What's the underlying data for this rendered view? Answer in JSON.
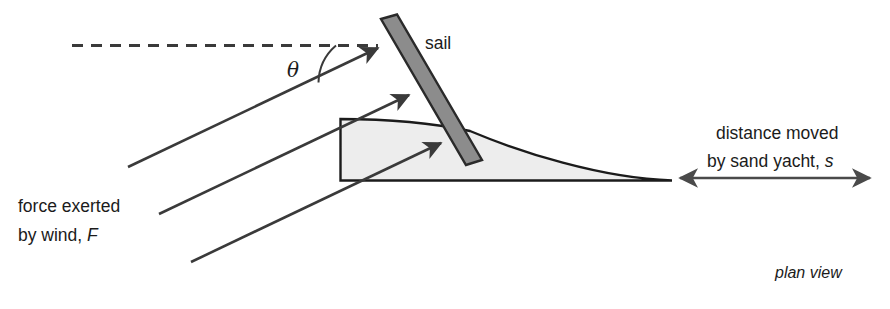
{
  "figure": {
    "title_note": "plan view",
    "background_color": "#ffffff",
    "stroke_color": "#3a3a3a",
    "outline_color": "#1b1b1b",
    "hull_fill_color": "#ededed",
    "sail_fill_color": "#8c8c8c",
    "text_color": "#1b1b1b"
  },
  "labels": {
    "sail": "sail",
    "angle_symbol": "θ",
    "force_line1": "force exerted",
    "force_line2_prefix": "by wind, ",
    "force_symbol": "F",
    "distance_line1": "distance moved",
    "distance_line2_prefix": "by sand yacht, ",
    "distance_symbol": "s",
    "plan_view": "plan view"
  },
  "elements": {
    "dashed_reference_line": "dashed-wind-reference-line",
    "force_arrows_count": 3,
    "distance_arrow": "double-headed-distance-arrow",
    "sail_shape": "tilted-gray-sail-bar",
    "hull_shape": "sand-yacht-hull-outline",
    "angle_arc": "theta-angle-arc"
  }
}
